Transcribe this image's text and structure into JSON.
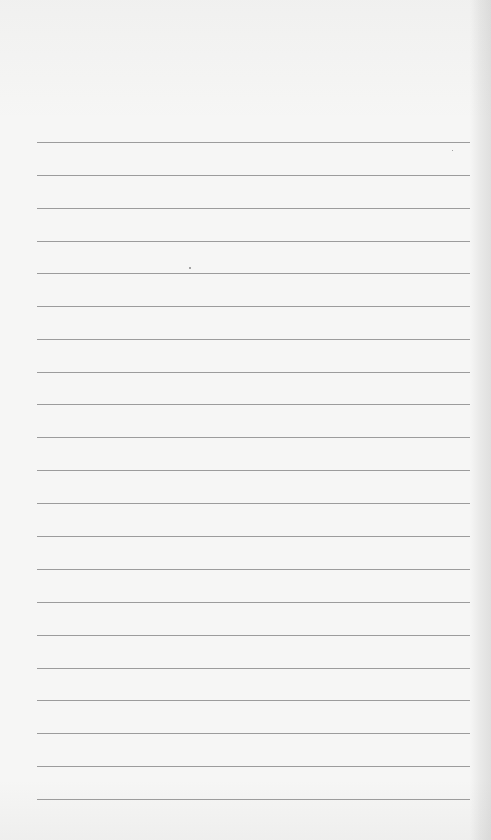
{
  "document": {
    "type": "lined-paper",
    "ghost_text": "",
    "rule_count": 21,
    "rule_color": "#8c8c8c",
    "paper_color": "#f6f6f5",
    "rules": [
      142,
      175,
      208,
      241,
      273,
      306,
      339,
      372,
      404,
      437,
      470,
      503,
      536,
      569,
      602,
      635,
      668,
      700,
      733,
      766,
      799
    ]
  }
}
